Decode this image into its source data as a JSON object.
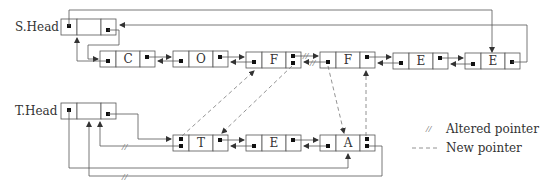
{
  "diagram": {
    "s_head_label": "S.Head",
    "t_head_label": "T.Head",
    "s_list": [
      "C",
      "O",
      "F",
      "F",
      "E",
      "E"
    ],
    "t_list": [
      "T",
      "E",
      "A"
    ],
    "legend": {
      "altered_symbol": "//",
      "altered_label": "Altered pointer",
      "new_label": "New pointer"
    },
    "colors": {
      "line": "#555555",
      "dashed": "#777777",
      "dot": "#111111"
    }
  }
}
